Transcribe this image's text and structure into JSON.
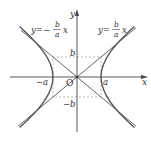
{
  "diagram": {
    "axes": {
      "x_label": "x",
      "y_label": "y",
      "origin_label": "O"
    },
    "ticks": {
      "neg_a": "−a",
      "pos_a": "a",
      "pos_b": "b",
      "neg_b": "−b"
    },
    "asymptotes": {
      "positive": {
        "lhs": "y=",
        "num": "b",
        "den": "a",
        "var": "x"
      },
      "negative": {
        "lhs": "y=−",
        "num": "b",
        "den": "a",
        "var": "x"
      }
    },
    "colors": {
      "curve": "#555555",
      "axis": "#444444",
      "dashed": "#999999",
      "text": "#333333"
    },
    "geometry": {
      "origin": [
        77,
        77
      ],
      "a_px": 24,
      "b_px": 20
    }
  }
}
